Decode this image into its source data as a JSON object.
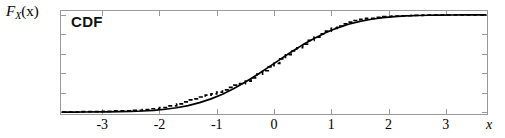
{
  "figure": {
    "annotation": "CDF",
    "y_axis_label_main": "F",
    "y_axis_label_sub": "X",
    "y_axis_label_arg": "(x)",
    "x_axis_label": "x"
  },
  "chart_data": {
    "type": "line",
    "title": "CDF",
    "xlabel": "x",
    "ylabel": "F_X(x)",
    "xlim": [
      -3.72,
      3.72
    ],
    "ylim": [
      -0.02,
      1.04
    ],
    "grid": false,
    "legend": null,
    "xticks": [
      -3,
      -2,
      -1,
      0,
      1,
      2,
      3
    ],
    "xticklabels": [
      "-3",
      "-2",
      "-1",
      "0",
      "1",
      "2",
      "3"
    ],
    "yticks": [
      0.0,
      0.2,
      0.4,
      0.6,
      0.8,
      1.0
    ],
    "yticklabels": [
      "",
      "",
      "",
      "",
      "",
      ""
    ],
    "series": [
      {
        "name": "theoretical-cdf",
        "style": "solid",
        "color": "#000000",
        "x": [
          -3.7,
          -3.5,
          -3.3,
          -3.1,
          -2.9,
          -2.7,
          -2.5,
          -2.3,
          -2.1,
          -1.9,
          -1.7,
          -1.5,
          -1.3,
          -1.1,
          -0.9,
          -0.7,
          -0.5,
          -0.3,
          -0.1,
          0.1,
          0.3,
          0.5,
          0.7,
          0.9,
          1.1,
          1.3,
          1.5,
          1.7,
          1.9,
          2.1,
          2.3,
          2.5,
          2.7,
          2.9,
          3.1,
          3.3,
          3.5,
          3.7
        ],
        "y": [
          0.0001,
          0.0002,
          0.0005,
          0.001,
          0.0019,
          0.0035,
          0.0062,
          0.0107,
          0.0179,
          0.0287,
          0.0446,
          0.0668,
          0.0968,
          0.1357,
          0.1841,
          0.242,
          0.3085,
          0.3821,
          0.4602,
          0.5398,
          0.6179,
          0.6915,
          0.758,
          0.8159,
          0.8643,
          0.9032,
          0.9332,
          0.9554,
          0.9713,
          0.9821,
          0.9893,
          0.9938,
          0.9965,
          0.9981,
          0.999,
          0.9995,
          0.9998,
          0.9999
        ]
      },
      {
        "name": "empirical-cdf",
        "style": "dashed",
        "color": "#000000",
        "x": [
          -3.7,
          -3.35,
          -3.2,
          -3.0,
          -2.8,
          -2.6,
          -2.45,
          -2.3,
          -2.15,
          -2.0,
          -1.85,
          -1.7,
          -1.6,
          -1.5,
          -1.4,
          -1.3,
          -1.2,
          -1.1,
          -1.0,
          -0.9,
          -0.8,
          -0.7,
          -0.6,
          -0.5,
          -0.4,
          -0.3,
          -0.2,
          -0.1,
          0.0,
          0.1,
          0.2,
          0.3,
          0.4,
          0.5,
          0.6,
          0.7,
          0.8,
          0.9,
          1.0,
          1.1,
          1.2,
          1.3,
          1.4,
          1.5,
          1.6,
          1.75,
          1.9,
          2.05,
          2.2,
          2.4,
          2.6,
          2.8,
          3.0,
          3.3,
          3.7
        ],
        "y": [
          0.0,
          0.004,
          0.004,
          0.008,
          0.012,
          0.012,
          0.018,
          0.026,
          0.034,
          0.046,
          0.063,
          0.085,
          0.105,
          0.125,
          0.135,
          0.155,
          0.175,
          0.188,
          0.205,
          0.228,
          0.255,
          0.277,
          0.292,
          0.318,
          0.352,
          0.39,
          0.425,
          0.465,
          0.5,
          0.548,
          0.59,
          0.63,
          0.662,
          0.7,
          0.738,
          0.772,
          0.805,
          0.832,
          0.862,
          0.885,
          0.908,
          0.925,
          0.942,
          0.955,
          0.965,
          0.975,
          0.982,
          0.987,
          0.991,
          0.994,
          0.997,
          0.998,
          0.999,
          1.0,
          1.0
        ]
      }
    ]
  }
}
